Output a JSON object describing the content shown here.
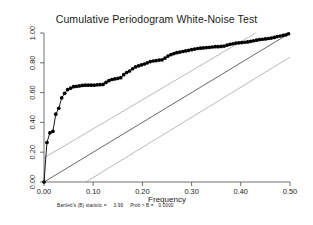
{
  "chart_data": {
    "type": "line",
    "title": "Cumulative Periodogram White-Noise Test",
    "xlabel": "Frequency",
    "ylabel": "",
    "xlim": [
      0.0,
      0.5
    ],
    "ylim": [
      0.0,
      1.0
    ],
    "grid": false,
    "legend": "none",
    "xticks": [
      "0.00",
      "0.10",
      "0.20",
      "0.30",
      "0.40",
      "0.50"
    ],
    "xtick_values": [
      0.0,
      0.1,
      0.2,
      0.3,
      0.4,
      0.5
    ],
    "yticks": [
      "0.00",
      "0.20",
      "0.40",
      "0.60",
      "0.80",
      "1.00"
    ],
    "ytick_values": [
      0.0,
      0.2,
      0.4,
      0.6,
      0.8,
      1.0
    ],
    "series": [
      {
        "name": "Cumulative periodogram",
        "marker": "filled-circle",
        "x": [
          0.0,
          0.006,
          0.012,
          0.018,
          0.024,
          0.03,
          0.036,
          0.042,
          0.048,
          0.054,
          0.06,
          0.066,
          0.072,
          0.078,
          0.084,
          0.09,
          0.096,
          0.102,
          0.108,
          0.114,
          0.12,
          0.126,
          0.132,
          0.138,
          0.144,
          0.15,
          0.156,
          0.162,
          0.168,
          0.174,
          0.18,
          0.186,
          0.192,
          0.198,
          0.204,
          0.21,
          0.216,
          0.222,
          0.228,
          0.234,
          0.24,
          0.246,
          0.252,
          0.258,
          0.264,
          0.27,
          0.276,
          0.282,
          0.288,
          0.294,
          0.3,
          0.306,
          0.312,
          0.318,
          0.324,
          0.33,
          0.336,
          0.342,
          0.348,
          0.354,
          0.36,
          0.366,
          0.372,
          0.378,
          0.384,
          0.39,
          0.396,
          0.402,
          0.408,
          0.414,
          0.42,
          0.426,
          0.432,
          0.438,
          0.444,
          0.45,
          0.456,
          0.462,
          0.468,
          0.474,
          0.48,
          0.486,
          0.492,
          0.497
        ],
        "y": [
          0.0,
          0.265,
          0.33,
          0.34,
          0.455,
          0.495,
          0.565,
          0.595,
          0.62,
          0.63,
          0.64,
          0.642,
          0.645,
          0.648,
          0.65,
          0.65,
          0.65,
          0.65,
          0.652,
          0.653,
          0.655,
          0.668,
          0.68,
          0.688,
          0.692,
          0.696,
          0.7,
          0.72,
          0.735,
          0.745,
          0.76,
          0.772,
          0.78,
          0.786,
          0.792,
          0.8,
          0.808,
          0.812,
          0.815,
          0.818,
          0.82,
          0.832,
          0.845,
          0.855,
          0.862,
          0.868,
          0.872,
          0.876,
          0.88,
          0.884,
          0.888,
          0.892,
          0.896,
          0.898,
          0.9,
          0.902,
          0.904,
          0.906,
          0.908,
          0.908,
          0.91,
          0.912,
          0.918,
          0.924,
          0.928,
          0.932,
          0.934,
          0.936,
          0.938,
          0.94,
          0.944,
          0.948,
          0.952,
          0.956,
          0.958,
          0.96,
          0.963,
          0.966,
          0.97,
          0.976,
          0.98,
          0.984,
          0.988,
          0.995
        ]
      }
    ],
    "reference_lines": [
      {
        "name": "45-degree-reference",
        "x": [
          0.0,
          0.5
        ],
        "y": [
          0.0,
          1.0
        ],
        "style": "solid",
        "color": "#000000"
      },
      {
        "name": "upper-confidence-band",
        "x": [
          0.0,
          0.43
        ],
        "y": [
          0.162,
          1.0
        ],
        "style": "solid",
        "color": "#8c8c8c"
      },
      {
        "name": "lower-confidence-band",
        "x": [
          0.085,
          0.5
        ],
        "y": [
          0.0,
          0.838
        ],
        "style": "solid",
        "color": "#8c8c8c"
      }
    ]
  },
  "footnote": {
    "statistic_label": "Bartlett's (B) statistic =",
    "statistic_value": "3.99",
    "prob_label": "Prob > B =",
    "prob_value": "0.0000"
  }
}
